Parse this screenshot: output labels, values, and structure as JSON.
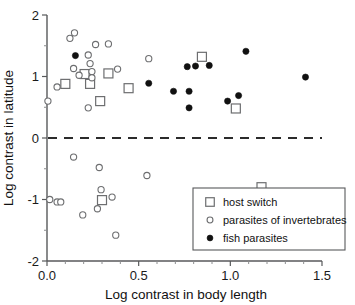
{
  "chart_data": {
    "type": "scatter",
    "title": "",
    "xlabel": "Log contrast in body length",
    "ylabel": "Log contrast in latitude",
    "xlim": [
      0.0,
      1.5
    ],
    "ylim": [
      -2,
      2
    ],
    "xticks": [
      "0.0",
      "0.5",
      "1.0",
      "1.5"
    ],
    "xtick_values": [
      0.0,
      0.5,
      1.0,
      1.5
    ],
    "yticks": [
      "2",
      "1",
      "0",
      "-1",
      "-2"
    ],
    "ytick_values": [
      2,
      1,
      0,
      -1,
      -2
    ],
    "grid": false,
    "reference_line": {
      "type": "horizontal-dashed",
      "y": 0
    },
    "legend_position": "bottom-right",
    "series": [
      {
        "name": "host switch",
        "marker": "open-square",
        "points": [
          [
            0.1,
            0.88
          ],
          [
            0.205,
            1.04
          ],
          [
            0.235,
            0.88
          ],
          [
            0.29,
            0.6
          ],
          [
            0.335,
            1.05
          ],
          [
            0.445,
            0.81
          ],
          [
            0.845,
            1.32
          ],
          [
            1.03,
            0.48
          ],
          [
            0.3,
            -1.01
          ],
          [
            1.17,
            -0.8
          ]
        ]
      },
      {
        "name": "parasites of invertebrates",
        "marker": "open-circle",
        "points": [
          [
            0.005,
            0.6
          ],
          [
            0.055,
            0.83
          ],
          [
            0.125,
            1.62
          ],
          [
            0.15,
            1.71
          ],
          [
            0.145,
            1.13
          ],
          [
            0.175,
            1.02
          ],
          [
            0.225,
            1.35
          ],
          [
            0.235,
            1.21
          ],
          [
            0.245,
            1.08
          ],
          [
            0.245,
            0.98
          ],
          [
            0.225,
            0.49
          ],
          [
            0.265,
            1.52
          ],
          [
            0.335,
            1.53
          ],
          [
            0.385,
            1.12
          ],
          [
            0.555,
            1.29
          ],
          [
            0.145,
            -0.31
          ],
          [
            0.285,
            -0.48
          ],
          [
            0.295,
            -0.84
          ],
          [
            0.275,
            -1.15
          ],
          [
            0.195,
            -1.25
          ],
          [
            0.355,
            -0.96
          ],
          [
            0.375,
            -1.58
          ],
          [
            0.545,
            -0.61
          ],
          [
            0.015,
            -1.0
          ],
          [
            0.055,
            -1.04
          ],
          [
            0.075,
            -1.04
          ]
        ]
      },
      {
        "name": "fish parasites",
        "marker": "filled-circle",
        "points": [
          [
            0.155,
            1.34
          ],
          [
            0.555,
            0.89
          ],
          [
            0.69,
            0.76
          ],
          [
            0.765,
            1.16
          ],
          [
            0.775,
            0.76
          ],
          [
            0.775,
            0.49
          ],
          [
            0.81,
            1.17
          ],
          [
            0.885,
            1.18
          ],
          [
            0.985,
            0.6
          ],
          [
            1.045,
            0.69
          ],
          [
            1.085,
            1.41
          ],
          [
            1.41,
            0.99
          ]
        ]
      }
    ]
  },
  "legend": {
    "items": [
      {
        "label": "host switch",
        "marker": "open-square"
      },
      {
        "label": "parasites of invertebrates",
        "marker": "open-circle"
      },
      {
        "label": "fish parasites",
        "marker": "filled-circle"
      }
    ]
  },
  "axes": {
    "x_title": "Log contrast in body length",
    "y_title": "Log contrast in latitude"
  }
}
